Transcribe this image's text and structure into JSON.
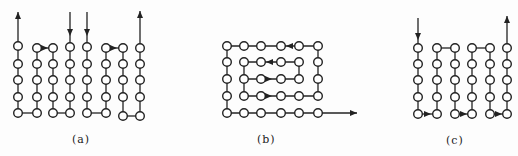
{
  "colors": {
    "stroke": "#222222",
    "background": "#fdfdfd"
  },
  "node_radius": 4.3,
  "panels": [
    {
      "id": "a",
      "label": "(a)",
      "label_pos": [
        72,
        133
      ],
      "columns": [
        18,
        37,
        53,
        70,
        87,
        106,
        123,
        140
      ],
      "rows": [
        46,
        64,
        80,
        97,
        113
      ],
      "nodes_per_column": [
        [
          46,
          64,
          80,
          97,
          113
        ],
        [
          48,
          64,
          80,
          97,
          113
        ],
        [
          48,
          64,
          80,
          97,
          113
        ],
        [
          47,
          64,
          80,
          97,
          113
        ],
        [
          47,
          64,
          80,
          97,
          113
        ],
        [
          48,
          64,
          80,
          97,
          113
        ],
        [
          48,
          64,
          80,
          97,
          116
        ],
        [
          48,
          64,
          80,
          97,
          116
        ]
      ],
      "lines": [
        [
          [
            18,
            113
          ],
          [
            18,
            12
          ]
        ],
        [
          [
            18,
            113
          ],
          [
            37,
            113
          ]
        ],
        [
          [
            37,
            113
          ],
          [
            37,
            48
          ]
        ],
        [
          [
            37,
            48
          ],
          [
            53,
            48
          ]
        ],
        [
          [
            53,
            48
          ],
          [
            53,
            113
          ]
        ],
        [
          [
            53,
            113
          ],
          [
            70,
            113
          ]
        ],
        [
          [
            70,
            113
          ],
          [
            70,
            12
          ]
        ],
        [
          [
            87,
            12
          ],
          [
            87,
            113
          ]
        ],
        [
          [
            87,
            113
          ],
          [
            106,
            113
          ]
        ],
        [
          [
            106,
            113
          ],
          [
            106,
            48
          ]
        ],
        [
          [
            106,
            48
          ],
          [
            123,
            48
          ]
        ],
        [
          [
            123,
            48
          ],
          [
            123,
            116
          ]
        ],
        [
          [
            123,
            116
          ],
          [
            140,
            116
          ]
        ],
        [
          [
            140,
            116
          ],
          [
            140,
            11
          ]
        ]
      ],
      "arrows": [
        {
          "at": [
            18,
            12
          ],
          "dir": "up"
        },
        {
          "at": [
            70,
            36
          ],
          "dir": "down"
        },
        {
          "at": [
            87,
            36
          ],
          "dir": "down"
        },
        {
          "at": [
            140,
            11
          ],
          "dir": "up"
        },
        {
          "at": [
            48,
            48
          ],
          "dir": "right"
        },
        {
          "at": [
            117,
            48
          ],
          "dir": "right"
        }
      ]
    },
    {
      "id": "b",
      "label": "(b)",
      "label_pos": [
        257,
        133
      ],
      "columns": [
        227,
        244,
        261,
        281,
        299,
        318
      ],
      "rows": [
        46,
        62,
        79,
        96,
        113
      ],
      "nodes": [
        [
          227,
          46
        ],
        [
          244,
          46
        ],
        [
          261,
          46
        ],
        [
          281,
          46
        ],
        [
          299,
          46
        ],
        [
          318,
          46
        ],
        [
          227,
          62
        ],
        [
          244,
          62
        ],
        [
          261,
          62
        ],
        [
          281,
          62
        ],
        [
          299,
          62
        ],
        [
          318,
          62
        ],
        [
          227,
          79
        ],
        [
          244,
          79
        ],
        [
          261,
          79
        ],
        [
          281,
          79
        ],
        [
          299,
          79
        ],
        [
          318,
          79
        ],
        [
          227,
          96
        ],
        [
          244,
          96
        ],
        [
          261,
          96
        ],
        [
          281,
          96
        ],
        [
          299,
          96
        ],
        [
          318,
          96
        ],
        [
          227,
          113
        ],
        [
          244,
          113
        ],
        [
          261,
          113
        ],
        [
          281,
          113
        ],
        [
          299,
          113
        ],
        [
          318,
          113
        ]
      ],
      "lines": [
        [
          [
            299,
            79
          ],
          [
            244,
            79
          ]
        ],
        [
          [
            244,
            79
          ],
          [
            244,
            62
          ]
        ],
        [
          [
            244,
            62
          ],
          [
            299,
            62
          ]
        ],
        [
          [
            299,
            62
          ],
          [
            299,
            79
          ]
        ],
        [
          [
            244,
            79
          ],
          [
            244,
            96
          ]
        ],
        [
          [
            244,
            96
          ],
          [
            318,
            96
          ]
        ],
        [
          [
            318,
            96
          ],
          [
            318,
            46
          ]
        ],
        [
          [
            318,
            46
          ],
          [
            227,
            46
          ]
        ],
        [
          [
            227,
            46
          ],
          [
            227,
            113
          ]
        ],
        [
          [
            227,
            113
          ],
          [
            357,
            113
          ]
        ]
      ],
      "arrows": [
        {
          "at": [
            286,
            46
          ],
          "dir": "left"
        },
        {
          "at": [
            266,
            62
          ],
          "dir": "left"
        },
        {
          "at": [
            272,
            79
          ],
          "dir": "right"
        },
        {
          "at": [
            272,
            96
          ],
          "dir": "right"
        },
        {
          "at": [
            357,
            113
          ],
          "dir": "right"
        }
      ]
    },
    {
      "id": "c",
      "label": "(c)",
      "label_pos": [
        446,
        134
      ],
      "columns": [
        418,
        437,
        455,
        472,
        490,
        507
      ],
      "rows": [
        48,
        64,
        80,
        97,
        114
      ],
      "nodes_per_column": [
        [
          48,
          64,
          80,
          97,
          114
        ],
        [
          48,
          64,
          80,
          97,
          114
        ],
        [
          48,
          64,
          80,
          97,
          114
        ],
        [
          48,
          64,
          80,
          97,
          114
        ],
        [
          48,
          64,
          80,
          97,
          114
        ],
        [
          48,
          64,
          80,
          97,
          114
        ]
      ],
      "lines": [
        [
          [
            418,
            18
          ],
          [
            418,
            114
          ]
        ],
        [
          [
            418,
            114
          ],
          [
            437,
            114
          ]
        ],
        [
          [
            437,
            114
          ],
          [
            437,
            48
          ]
        ],
        [
          [
            437,
            48
          ],
          [
            455,
            48
          ]
        ],
        [
          [
            455,
            48
          ],
          [
            455,
            114
          ]
        ],
        [
          [
            455,
            114
          ],
          [
            472,
            114
          ]
        ],
        [
          [
            472,
            114
          ],
          [
            472,
            48
          ]
        ],
        [
          [
            472,
            48
          ],
          [
            490,
            48
          ]
        ],
        [
          [
            490,
            48
          ],
          [
            490,
            114
          ]
        ],
        [
          [
            490,
            114
          ],
          [
            507,
            114
          ]
        ],
        [
          [
            507,
            114
          ],
          [
            507,
            16
          ]
        ]
      ],
      "arrows": [
        {
          "at": [
            418,
            40
          ],
          "dir": "down"
        },
        {
          "at": [
            507,
            16
          ],
          "dir": "up"
        },
        {
          "at": [
            431,
            114
          ],
          "dir": "right"
        },
        {
          "at": [
            467,
            114
          ],
          "dir": "right"
        },
        {
          "at": [
            502,
            114
          ],
          "dir": "right"
        }
      ]
    }
  ]
}
